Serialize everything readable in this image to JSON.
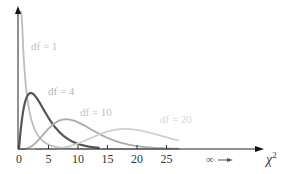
{
  "chart_data": {
    "type": "line",
    "title": "",
    "xlabel": "χ²",
    "ylabel": "",
    "x_ticks": [
      0,
      5,
      10,
      15,
      20,
      25
    ],
    "x_tick_labels": [
      "0",
      "5",
      "10",
      "15",
      "20",
      "25"
    ],
    "xlim": [
      0,
      27
    ],
    "grid": false,
    "legend": "inline labels",
    "annotations": [
      "∞ →"
    ],
    "series": [
      {
        "name": "df = 1",
        "df": 1,
        "color": "#bdbdbd",
        "x_range": [
          0.05,
          27
        ]
      },
      {
        "name": "df = 4",
        "df": 4,
        "color": "#555555",
        "x_range": [
          0,
          13.5
        ]
      },
      {
        "name": "df = 10",
        "df": 10,
        "color": "#ababab",
        "x_range": [
          0,
          27
        ]
      },
      {
        "name": "df = 20",
        "df": 20,
        "color": "#cfcfcf",
        "x_range": [
          3,
          27
        ]
      }
    ]
  },
  "labels": {
    "df1": "df = 1",
    "df4": "df = 4",
    "df10": "df = 10",
    "df20": "df = 20",
    "ticks": [
      "0",
      "5",
      "10",
      "15",
      "20",
      "25"
    ],
    "infinity": "∞",
    "xaxis_symbol": "χ",
    "xaxis_sup": "2"
  },
  "colors": {
    "axis": "#222222",
    "df1": "#bdbdbd",
    "df4": "#555555",
    "df10": "#ababab",
    "df20": "#cfcfcf"
  }
}
